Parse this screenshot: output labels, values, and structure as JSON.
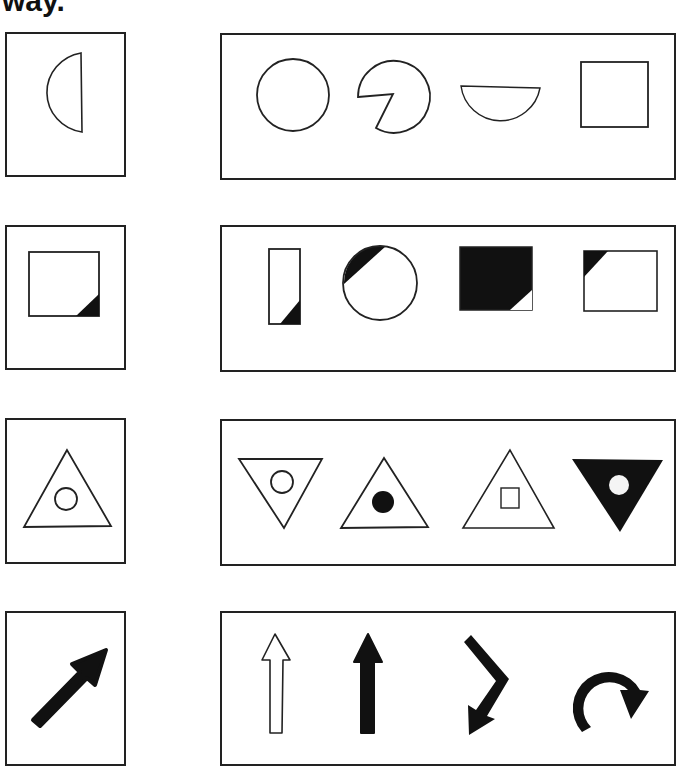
{
  "heading": "way.",
  "instructions": "Match the shape in the left box to the one in the right box that is the same but turned a different way.",
  "rows": [
    {
      "target": {
        "label": "half-circle-flat-right",
        "description": "Half circle with flat edge on the right"
      },
      "options": [
        {
          "label": "circle"
        },
        {
          "label": "circle-with-wedge-cut"
        },
        {
          "label": "half-circle-flat-top"
        },
        {
          "label": "square"
        }
      ]
    },
    {
      "target": {
        "label": "square-black-corner-bottom-right"
      },
      "options": [
        {
          "label": "tall-rectangle-black-corner-bottom-right"
        },
        {
          "label": "circle-black-segment-top-left"
        },
        {
          "label": "black-square-white-corner-bottom-right"
        },
        {
          "label": "square-black-corner-top-left"
        }
      ]
    },
    {
      "target": {
        "label": "triangle-with-circle"
      },
      "options": [
        {
          "label": "inverted-triangle-with-circle"
        },
        {
          "label": "triangle-with-black-dot"
        },
        {
          "label": "triangle-with-square"
        },
        {
          "label": "black-inverted-triangle-with-white-dot"
        }
      ]
    },
    {
      "target": {
        "label": "black-arrow-up-right"
      },
      "options": [
        {
          "label": "outline-arrow-up"
        },
        {
          "label": "black-arrow-up"
        },
        {
          "label": "bent-arrow-down-left"
        },
        {
          "label": "u-turn-arrow"
        }
      ]
    }
  ],
  "colors": {
    "ink": "#222222",
    "paper": "#ffffff"
  }
}
